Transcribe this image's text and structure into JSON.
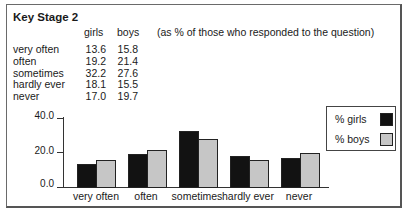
{
  "title": "Key Stage 2",
  "columns": {
    "girls": "girls",
    "boys": "boys"
  },
  "note": "(as % of those who responded to the question)",
  "table": {
    "rows": [
      {
        "label": "very often",
        "girls": "13.6",
        "boys": "15.8"
      },
      {
        "label": "often",
        "girls": "19.2",
        "boys": "21.4"
      },
      {
        "label": "sometimes",
        "girls": "32.2",
        "boys": "27.6"
      },
      {
        "label": "hardly ever",
        "girls": "18.1",
        "boys": "15.5"
      },
      {
        "label": "never",
        "girls": "17.0",
        "boys": "19.7"
      }
    ]
  },
  "axis": {
    "ticks": [
      "40.0",
      "20.0",
      "0.0"
    ]
  },
  "legend": {
    "girls": "% girls",
    "boys": "% boys"
  },
  "colors": {
    "girls": "#121212",
    "boys": "#c6c6c6"
  },
  "chart_data": {
    "type": "bar",
    "title": "Key Stage 2",
    "subtitle": "(as % of those who responded to the question)",
    "categories": [
      "very often",
      "often",
      "sometimes",
      "hardly ever",
      "never"
    ],
    "series": [
      {
        "name": "% girls",
        "values": [
          13.6,
          19.2,
          32.2,
          18.1,
          17.0
        ],
        "color": "#121212"
      },
      {
        "name": "% boys",
        "values": [
          15.8,
          21.4,
          27.6,
          15.5,
          19.7
        ],
        "color": "#c6c6c6"
      }
    ],
    "xlabel": "",
    "ylabel": "",
    "ylim": [
      0,
      40
    ],
    "yticks": [
      0.0,
      20.0,
      40.0
    ],
    "grid": false,
    "legend_position": "right"
  }
}
